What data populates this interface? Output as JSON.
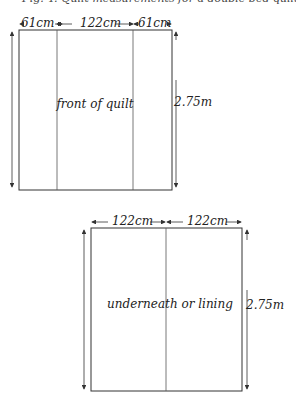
{
  "caption": "Fig. 4: Quilt measurements for a double bed quilt",
  "front": {
    "widths": [
      "61cm",
      "122cm",
      "61cm"
    ],
    "height": "2.75m",
    "label": "front of quilt"
  },
  "lining": {
    "widths": [
      "122cm",
      "122cm"
    ],
    "height": "2.75m",
    "label": "underneath or lining"
  },
  "colors": {
    "line": "#333333",
    "background": "#ffffff"
  }
}
